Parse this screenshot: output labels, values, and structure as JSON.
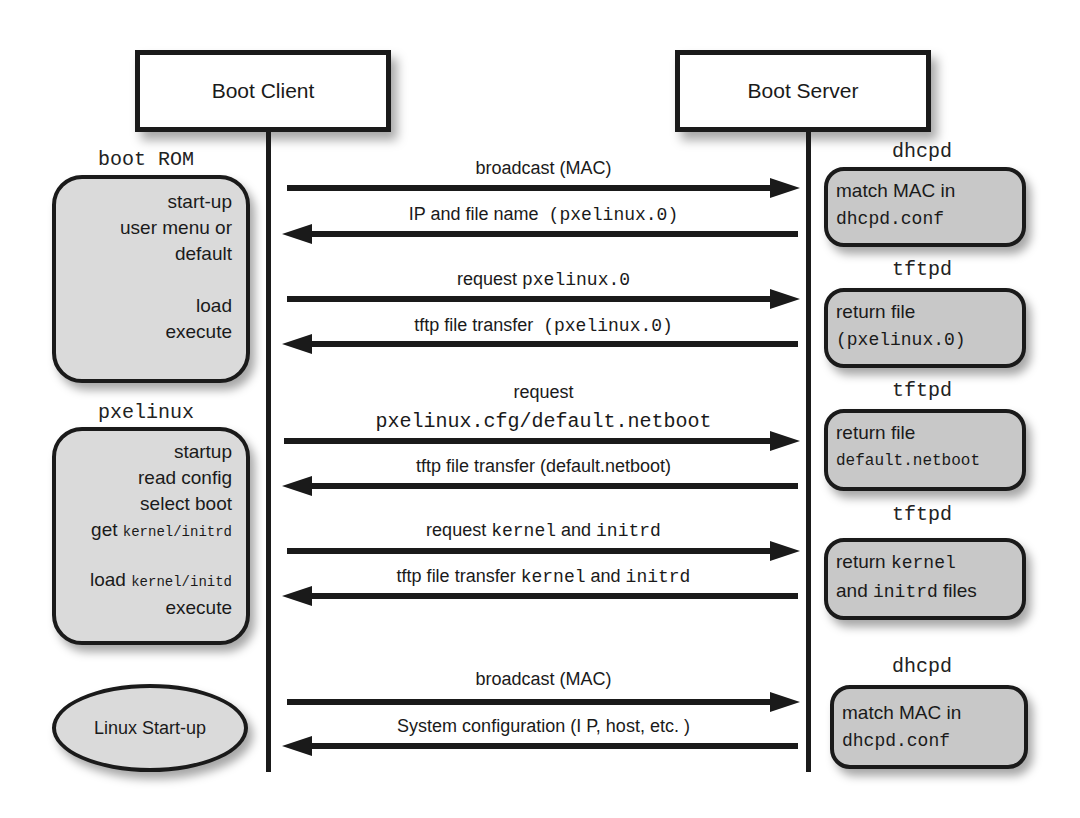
{
  "actors": {
    "client": "Boot Client",
    "server": "Boot Server"
  },
  "phases": [
    {
      "client_label": "boot ROM",
      "client_steps": [
        "start-up",
        "user menu or",
        "default",
        "",
        "load",
        "execute"
      ]
    },
    {
      "client_label": "pxelinux",
      "client_steps": [
        "startup",
        "read config",
        "select boot"
      ],
      "client_get_prefix": "get",
      "client_get_file": "kernel/initrd",
      "client_load_prefix": "load",
      "client_load_file": "kernel/initd",
      "client_last": "execute"
    },
    {
      "client_label": "Linux Start-up"
    }
  ],
  "messages": [
    {
      "direction": "right",
      "text": "broadcast (MAC)"
    },
    {
      "direction": "left",
      "text": "IP and file name",
      "mono": "(pxelinux.0)"
    },
    {
      "direction": "right",
      "text": "request",
      "mono": "pxelinux.0"
    },
    {
      "direction": "left",
      "text": "tftp file transfer",
      "mono": "(pxelinux.0)"
    },
    {
      "direction": "right",
      "text": "request",
      "mono": "pxelinux.cfg/default.netboot"
    },
    {
      "direction": "left",
      "text": "tftp file transfer (default.netboot)"
    },
    {
      "direction": "right",
      "text": "request",
      "mono1": "kernel",
      "and": "and",
      "mono2": "initrd"
    },
    {
      "direction": "left",
      "text": "tftp file transfer",
      "mono1": "kernel",
      "and": "and",
      "mono2": "initrd"
    },
    {
      "direction": "right",
      "text": "broadcast (MAC)"
    },
    {
      "direction": "left",
      "text": "System configuration (I P, host, etc. )"
    }
  ],
  "server_steps": [
    {
      "daemon": "dhcpd",
      "line1": "match MAC in",
      "line2_mono": "dhcpd.conf"
    },
    {
      "daemon": "tftpd",
      "line1": "return file",
      "line2_mono": "(pxelinux.0)"
    },
    {
      "daemon": "tftpd",
      "line1": "return file",
      "line2_mono": "default.netboot"
    },
    {
      "daemon": "tftpd",
      "line1_text": "return",
      "line1_mono": "kernel",
      "line2_text_a": "and",
      "line2_mono": "initrd",
      "line2_text_b": "files"
    },
    {
      "daemon": "dhcpd",
      "line1": "match MAC in",
      "line2_mono": "dhcpd.conf"
    }
  ],
  "colors": {
    "line": "#1a1a1a",
    "client_box_fill": "#dadada",
    "server_box_fill": "#c8c8c8",
    "background": "#ffffff"
  }
}
